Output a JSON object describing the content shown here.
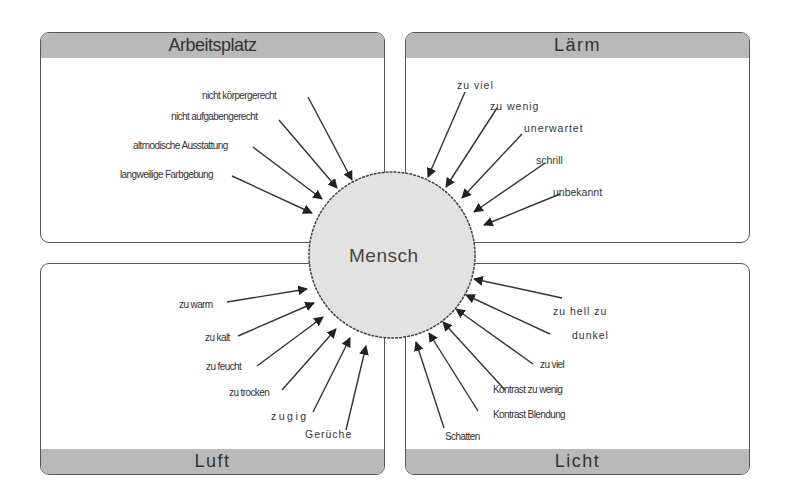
{
  "center": {
    "label": "Mensch",
    "fill": "#e2e2e2"
  },
  "header_color": "#b9b9b9",
  "quadrants": {
    "arbeitsplatz": {
      "title": "Arbeitsplatz",
      "factors": [
        "nicht körpergerecht",
        "nicht aufgabengerecht",
        "altmodische Ausstattung",
        "langweilige Farbgebung"
      ]
    },
    "laerm": {
      "title": "Lärm",
      "factors": [
        "zu viel",
        "zu wenig",
        "unerwartet",
        "schrill",
        "unbekannt"
      ]
    },
    "luft": {
      "title": "Luft",
      "factors": [
        "zu warm",
        "zu kalt",
        "zu feucht",
        "zu trocken",
        "zugig",
        "Gerüche"
      ]
    },
    "licht": {
      "title": "Licht",
      "factors": [
        "zu hell zu",
        "dunkel",
        "zu viel",
        "Kontrast zu wenig",
        "Kontrast Blendung",
        "Schatten"
      ]
    }
  }
}
